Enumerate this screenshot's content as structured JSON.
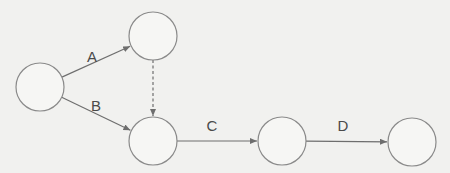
{
  "diagram": {
    "type": "activity-on-arrow network",
    "colors": {
      "background": "#f1f1ef",
      "node_stroke": "#8a8a8a",
      "edge": "#6e6e6e",
      "label": "#4a4a4a"
    },
    "nodes": [
      {
        "id": "n1",
        "cx": 40,
        "cy": 87,
        "r": 24
      },
      {
        "id": "n2",
        "cx": 153,
        "cy": 36,
        "r": 24
      },
      {
        "id": "n3",
        "cx": 153,
        "cy": 141,
        "r": 24
      },
      {
        "id": "n4",
        "cx": 282,
        "cy": 141,
        "r": 24
      },
      {
        "id": "n5",
        "cx": 412,
        "cy": 142,
        "r": 24
      }
    ],
    "edges": [
      {
        "id": "A",
        "label": "A",
        "from": "n1",
        "to": "n2",
        "style": "solid",
        "label_x": 92,
        "label_y": 56
      },
      {
        "id": "B",
        "label": "B",
        "from": "n1",
        "to": "n3",
        "style": "solid",
        "label_x": 96,
        "label_y": 105
      },
      {
        "id": "dummy",
        "label": "",
        "from": "n2",
        "to": "n3",
        "style": "dashed"
      },
      {
        "id": "C",
        "label": "C",
        "from": "n3",
        "to": "n4",
        "style": "solid",
        "label_x": 212,
        "label_y": 125
      },
      {
        "id": "D",
        "label": "D",
        "from": "n4",
        "to": "n5",
        "style": "solid",
        "label_x": 343,
        "label_y": 125
      }
    ]
  }
}
